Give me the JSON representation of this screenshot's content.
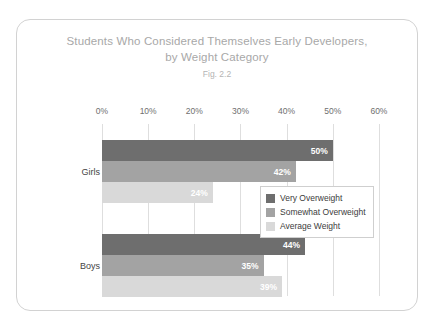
{
  "chart_data": {
    "type": "bar",
    "orientation": "horizontal",
    "title": "Students Who Considered Themselves Early Developers, by Weight Category",
    "title_lines": [
      "Students Who Considered Themselves Early Developers,",
      "by Weight Category"
    ],
    "subtitle": "Fig. 2.2",
    "xlabel": "",
    "ylabel": "",
    "xlim": [
      0,
      65
    ],
    "axis_max_label": 60,
    "grid": true,
    "grid_axis": "x",
    "legend_position": "inside-right",
    "categories": [
      "Girls",
      "Boys"
    ],
    "tick_labels": [
      "0%",
      "10%",
      "20%",
      "30%",
      "40%",
      "50%",
      "60%"
    ],
    "tick_values": [
      0,
      10,
      20,
      30,
      40,
      50,
      60
    ],
    "series": [
      {
        "name": "Very Overweight",
        "color": "#6e6e6e",
        "values": [
          50,
          44
        ],
        "value_labels": [
          "50%",
          "44%"
        ]
      },
      {
        "name": "Somewhat Overweight",
        "color": "#a3a3a3",
        "values": [
          42,
          35
        ],
        "value_labels": [
          "42%",
          "35%"
        ]
      },
      {
        "name": "Average Weight",
        "color": "#d9d9d9",
        "values": [
          24,
          39
        ],
        "value_labels": [
          "24%",
          "39%"
        ]
      }
    ]
  },
  "style": {
    "card_background": "#ffffff",
    "card_border": "#d2d2d2",
    "title_color": "#a8a8a8",
    "subtitle_color": "#b4b4b4",
    "tick_color": "#6f6f6f",
    "grid_color": "#dedede",
    "category_color": "#444444",
    "value_label_color": "#ffffff",
    "legend_border": "#cfcfcf",
    "legend_text_color": "#3c3c3c"
  }
}
